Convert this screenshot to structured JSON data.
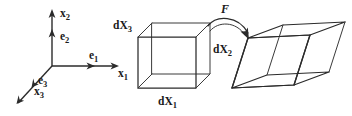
{
  "figure": {
    "background_color": "#ffffff",
    "ink_color": "#2b2b2b",
    "width": 352,
    "height": 116
  },
  "coordinate_frame": {
    "name": "reference-cartesian-frame",
    "origin_label": "",
    "axes": [
      {
        "id": "axis-x1",
        "axis_label": "x",
        "axis_subscript": "1",
        "basis_label": "e",
        "basis_subscript": "1",
        "direction": "right"
      },
      {
        "id": "axis-x2",
        "axis_label": "x",
        "axis_subscript": "2",
        "basis_label": "e",
        "basis_subscript": "2",
        "direction": "up"
      },
      {
        "id": "axis-x3",
        "axis_label": "x",
        "axis_subscript": "3",
        "basis_label": "e",
        "basis_subscript": "3",
        "direction": "down-left"
      }
    ]
  },
  "reference_element": {
    "name": "undeformed-cube",
    "shape": "cube",
    "edge_labels": [
      {
        "id": "edge-dX3",
        "label": "dX",
        "subscript": "3"
      },
      {
        "id": "edge-dX2",
        "label": "dX",
        "subscript": "2"
      },
      {
        "id": "edge-dX1",
        "label": "dX",
        "subscript": "1"
      }
    ]
  },
  "mapping": {
    "name": "deformation-gradient-arrow",
    "label": "F",
    "style": "curved-arrow",
    "from": "undeformed-cube",
    "to": "deformed-parallelepiped"
  },
  "deformed_element": {
    "name": "deformed-parallelepiped",
    "shape": "sheared-parallelepiped",
    "edge_labels": []
  }
}
